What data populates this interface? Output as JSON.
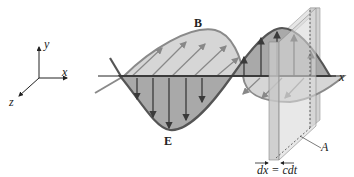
{
  "figure": {
    "colors": {
      "e_fill": "#a9a9a9",
      "b_fill": "#d6d6d6",
      "outline": "#555555",
      "arrow": "#3a3a3a",
      "slab": "#c8c8c8",
      "axis": "#222222"
    }
  },
  "axes": {
    "y_label": "y",
    "x_label": "x",
    "z_label": "z"
  },
  "labels": {
    "b_field": "B",
    "e_field": "E",
    "x_axis": "x",
    "area": "A",
    "thickness": "dx = cdt"
  }
}
